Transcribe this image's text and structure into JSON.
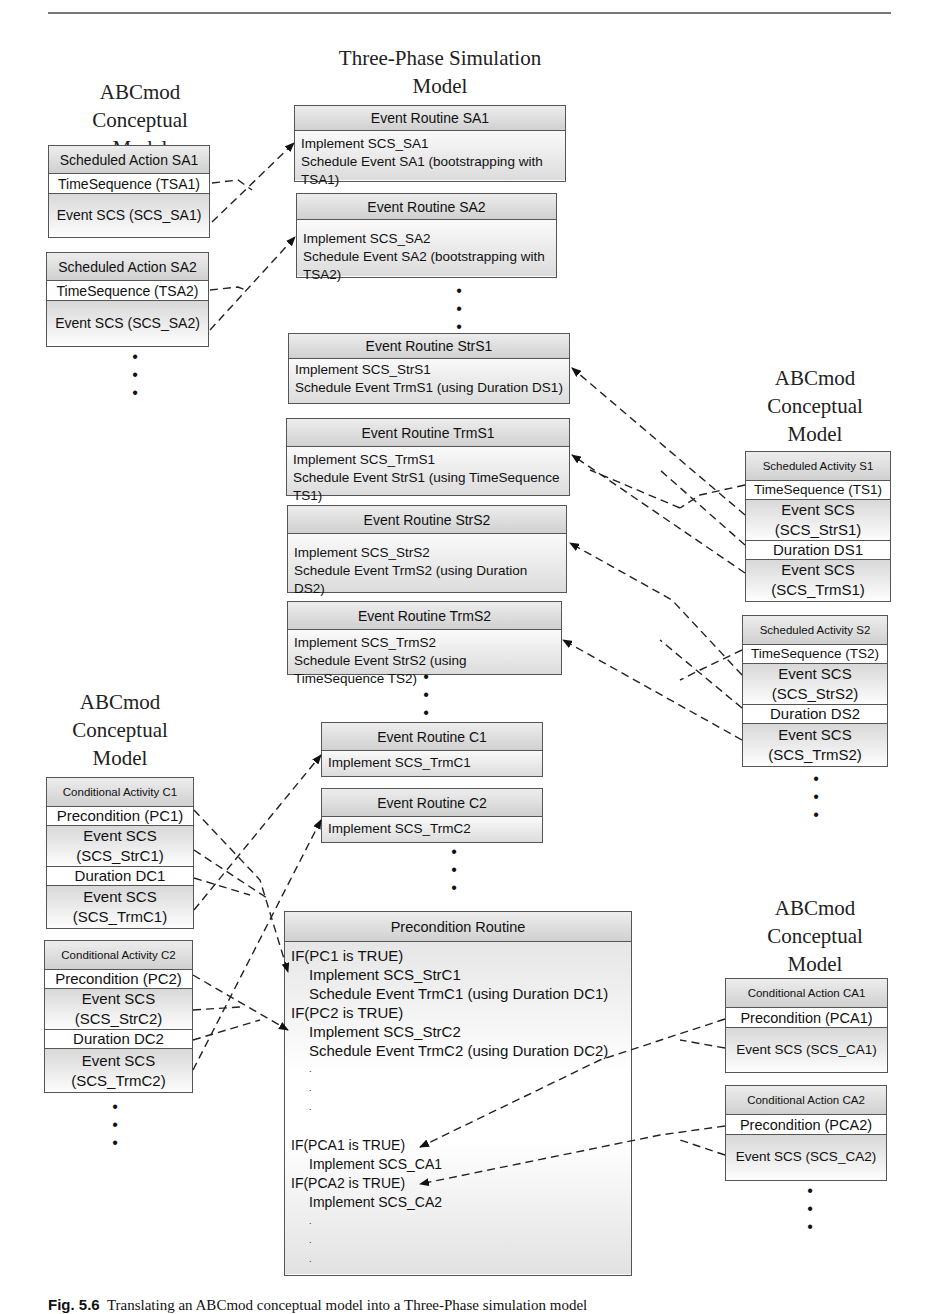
{
  "page": {
    "page_number": "157",
    "caption_label": "Fig. 5.6",
    "caption_text": "Translating an ABCmod conceptual model into a Three-Phase simulation model"
  },
  "headings": {
    "left_top": [
      "ABCmod",
      "Conceptual",
      "Model"
    ],
    "center": [
      "Three-Phase Simulation",
      "Model"
    ],
    "right_mid": [
      "ABCmod",
      "Conceptual",
      "Model"
    ],
    "left_bottom": [
      "ABCmod",
      "Conceptual",
      "Model"
    ],
    "right_bottom": [
      "ABCmod",
      "Conceptual",
      "Model"
    ]
  },
  "scheduled_actions": [
    {
      "title": "Scheduled Action SA1",
      "rows": [
        "TimeSequence (TSA1)",
        "Event SCS (SCS_SA1)"
      ]
    },
    {
      "title": "Scheduled Action SA2",
      "rows": [
        "TimeSequence (TSA2)",
        "Event SCS (SCS_SA2)"
      ]
    }
  ],
  "scheduled_activities": [
    {
      "title": "Scheduled Activity S1",
      "rows": [
        "TimeSequence (TS1)",
        "Event SCS",
        "(SCS_StrS1)",
        "Duration DS1",
        "Event SCS",
        "(SCS_TrmS1)"
      ]
    },
    {
      "title": "Scheduled Activity S2",
      "rows": [
        "TimeSequence (TS2)",
        "Event SCS",
        "(SCS_StrS2)",
        "Duration DS2",
        "Event SCS",
        "(SCS_TrmS2)"
      ]
    }
  ],
  "conditional_activities": [
    {
      "title": "Conditional Activity C1",
      "rows": [
        "Precondition (PC1)",
        "Event SCS",
        "(SCS_StrC1)",
        "Duration DC1",
        "Event SCS",
        "(SCS_TrmC1)"
      ]
    },
    {
      "title": "Conditional Activity C2",
      "rows": [
        "Precondition (PC2)",
        "Event SCS",
        "(SCS_StrC2)",
        "Duration DC2",
        "Event SCS",
        "(SCS_TrmC2)"
      ]
    }
  ],
  "conditional_actions": [
    {
      "title": "Conditional Action CA1",
      "rows": [
        "Precondition (PCA1)",
        "Event SCS (SCS_CA1)"
      ]
    },
    {
      "title": "Conditional Action CA2",
      "rows": [
        "Precondition (PCA2)",
        "Event SCS (SCS_CA2)"
      ]
    }
  ],
  "event_routines": [
    {
      "title": "Event Routine SA1",
      "lines": [
        "Implement SCS_SA1",
        "Schedule Event SA1 (bootstrapping with TSA1)"
      ]
    },
    {
      "title": "Event Routine SA2",
      "lines": [
        "Implement SCS_SA2",
        "Schedule Event SA2 (bootstrapping with TSA2)"
      ]
    },
    {
      "title": "Event Routine StrS1",
      "lines": [
        "Implement SCS_StrS1",
        "Schedule Event TrmS1 (using Duration DS1)"
      ]
    },
    {
      "title": "Event Routine TrmS1",
      "lines": [
        "Implement SCS_TrmS1",
        "Schedule Event StrS1 (using TimeSequence TS1)"
      ]
    },
    {
      "title": "Event Routine StrS2",
      "lines": [
        "Implement SCS_StrS2",
        "Schedule Event TrmS2 (using Duration DS2)"
      ]
    },
    {
      "title": "Event Routine TrmS2",
      "lines": [
        "Implement SCS_TrmS2",
        "Schedule Event StrS2 (using TimeSequence TS2)"
      ]
    },
    {
      "title": "Event Routine C1",
      "lines": [
        "Implement SCS_TrmC1"
      ]
    },
    {
      "title": "Event Routine C2",
      "lines": [
        "Implement SCS_TrmC2"
      ]
    }
  ],
  "precondition_routine": {
    "title": "Precondition Routine",
    "lines": [
      {
        "text": "IF(PC1 is TRUE)",
        "indent": false
      },
      {
        "text": "Implement SCS_StrC1",
        "indent": true
      },
      {
        "text": "Schedule Event TrmC1 (using Duration DC1)",
        "indent": true
      },
      {
        "text": "IF(PC2 is TRUE)",
        "indent": false
      },
      {
        "text": "Implement SCS_StrC2",
        "indent": true
      },
      {
        "text": "Schedule Event TrmC2 (using Duration DC2)",
        "indent": true
      },
      {
        "text": ".",
        "indent": true
      },
      {
        "text": ".",
        "indent": true
      },
      {
        "text": ".",
        "indent": true
      },
      {
        "text": "",
        "indent": false
      },
      {
        "text": "IF(PCA1 is TRUE)",
        "indent": false
      },
      {
        "text": "Implement SCS_CA1",
        "indent": true
      },
      {
        "text": "IF(PCA2 is TRUE)",
        "indent": false
      },
      {
        "text": "Implement SCS_CA2",
        "indent": true
      },
      {
        "text": ".",
        "indent": true
      },
      {
        "text": ".",
        "indent": true
      },
      {
        "text": ".",
        "indent": true
      }
    ]
  },
  "ellipsis": "•"
}
